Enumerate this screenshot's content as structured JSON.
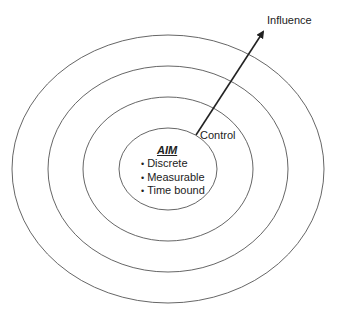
{
  "diagram": {
    "type": "concentric-circles",
    "center": {
      "title": "AIM",
      "bullets": [
        "Discrete",
        "Measurable",
        "Time bound"
      ]
    },
    "labels": {
      "control": "Control",
      "influence": "Influence"
    },
    "rings": [
      {
        "name": "aim-circle",
        "cx": 168,
        "cy": 169,
        "rx": 49,
        "ry": 41
      },
      {
        "name": "control-ring",
        "cx": 168,
        "cy": 169,
        "rx": 85,
        "ry": 72
      },
      {
        "name": "middle-ring",
        "cx": 168,
        "cy": 169,
        "rx": 120,
        "ry": 103
      },
      {
        "name": "outer-ring",
        "cx": 168,
        "cy": 169,
        "rx": 156,
        "ry": 134
      }
    ],
    "arrow": {
      "from": [
        196,
        135
      ],
      "to": [
        265,
        29
      ]
    },
    "colors": {
      "stroke": "#555555",
      "arrow": "#222222",
      "text": "#222222"
    }
  }
}
